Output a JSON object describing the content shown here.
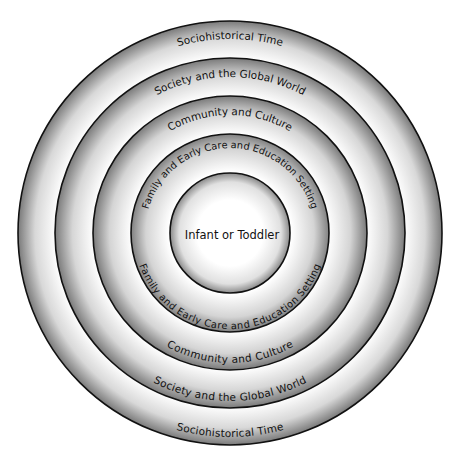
{
  "diagram": {
    "type": "concentric-circles",
    "center": "Infant or Toddler",
    "rings": [
      {
        "label": "Family and Early Care and Education Setting"
      },
      {
        "label": "Community and Culture"
      },
      {
        "label": "Society and the Global World"
      },
      {
        "label": "Sociohistorical Time"
      }
    ]
  },
  "labels": {
    "center": "Infant or Toddler",
    "ring1_top": "Family and Early Care and Education Setting",
    "ring1_bottom": "Family and Early Care and Education Setting",
    "ring2_top": "Community and Culture",
    "ring2_bottom": "Community and Culture",
    "ring3_top": "Society and the Global World",
    "ring3_bottom": "Society and the Global World",
    "ring4_top": "Sociohistorical Time",
    "ring4_bottom": "Sociohistorical Time"
  },
  "colors": {
    "ring_dark": "#7a7a7a",
    "ring_light": "#ffffff",
    "stroke": "#111111"
  }
}
